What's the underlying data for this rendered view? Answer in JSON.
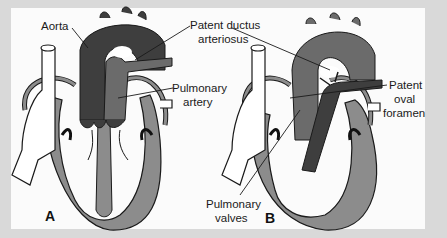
{
  "figure": {
    "background_color": "#d9d9d9",
    "panel_color": "#fbfbfb",
    "colors": {
      "aorta": "#3e3e3e",
      "pulmonary": "#6b6b6b",
      "heart_wall": "#8c8c8c",
      "outline": "#1a1a1a"
    },
    "panels": [
      {
        "id": "A",
        "tag": "A"
      },
      {
        "id": "B",
        "tag": "B"
      }
    ],
    "labels": {
      "aorta": "Aorta",
      "patent_ductus_line1": "Patent ductus",
      "patent_ductus_line2": "arteriosus",
      "pulmonary_artery_line1": "Pulmonary",
      "pulmonary_artery_line2": "artery",
      "patent_oval_line1": "Patent",
      "patent_oval_line2": "oval",
      "patent_oval_line3": "foramen",
      "pulmonary_valves_line1": "Pulmonary",
      "pulmonary_valves_line2": "valves"
    }
  }
}
